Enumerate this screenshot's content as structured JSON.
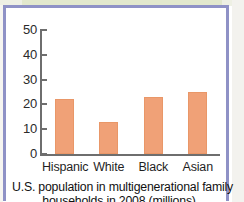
{
  "figure": {
    "caption_line1": "U.S. population in multigenerational family",
    "caption_line2": "households in 2008 (millions)",
    "frame_color": "#8f92c6",
    "bar_color": "#f0a177",
    "axis_color": "#6e6e6e"
  },
  "chart_data": {
    "type": "bar",
    "title": "U.S. population in multigenerational family households in 2008 (millions)",
    "xlabel": "",
    "ylabel": "",
    "categories": [
      "Hispanic",
      "White",
      "Black",
      "Asian"
    ],
    "values": [
      22,
      13,
      23,
      25
    ],
    "ylim": [
      0,
      50
    ],
    "yticks": [
      0,
      10,
      20,
      30,
      40,
      50
    ],
    "ytick_labels": [
      "0",
      "10",
      "20",
      "30",
      "40",
      "50"
    ],
    "grid": false,
    "legend": "none",
    "series": [
      {
        "name": "Population (millions)",
        "values": [
          22,
          13,
          23,
          25
        ]
      }
    ]
  }
}
